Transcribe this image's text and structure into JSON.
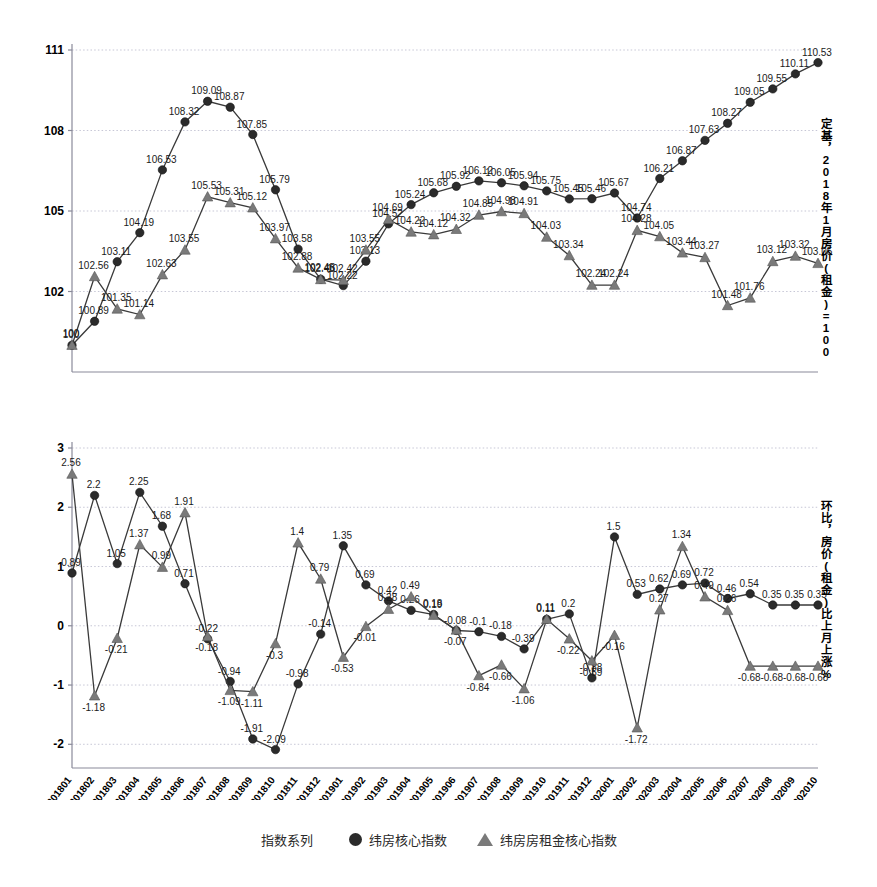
{
  "chart_data": [
    {
      "type": "line",
      "panel": "top",
      "title": "",
      "xlabel": "",
      "ylabel": "定基，2018年1月房价(租金)=100",
      "ylim": [
        99,
        111
      ],
      "yticks": [
        102,
        105,
        108,
        111
      ],
      "grid": true,
      "legend_position": "bottom",
      "categories": [
        "201801",
        "201802",
        "201803",
        "201804",
        "201805",
        "201806",
        "201807",
        "201808",
        "201809",
        "201810",
        "201811",
        "201812",
        "201901",
        "201902",
        "201903",
        "201904",
        "201905",
        "201906",
        "201907",
        "201908",
        "201909",
        "201910",
        "201911",
        "201912",
        "202001",
        "202002",
        "202003",
        "202004",
        "202005",
        "202006",
        "202007",
        "202008",
        "202009",
        "202010"
      ],
      "series": [
        {
          "name": "纬房核心指数",
          "marker": "circle",
          "values": [
            100,
            100.89,
            103.11,
            104.19,
            106.53,
            108.32,
            109.09,
            108.87,
            107.85,
            105.79,
            103.58,
            102.46,
            102.22,
            103.13,
            104.52,
            105.24,
            105.68,
            105.92,
            106.12,
            106.05,
            105.94,
            105.75,
            105.45,
            105.46,
            105.67,
            104.74,
            106.21,
            106.87,
            107.63,
            108.27,
            109.05,
            109.55,
            110.11,
            110.53
          ]
        },
        {
          "name": "纬房房租金核心指数",
          "marker": "triangle",
          "values": [
            100,
            102.56,
            101.35,
            101.14,
            102.63,
            103.55,
            105.53,
            105.31,
            105.12,
            103.97,
            102.88,
            102.45,
            102.42,
            103.55,
            104.69,
            104.22,
            104.12,
            104.32,
            104.85,
            104.98,
            104.91,
            104.03,
            103.34,
            102.24,
            102.24,
            104.28,
            104.05,
            103.44,
            103.27,
            101.48,
            101.76,
            103.12,
            103.32,
            103.05,
            102.35
          ]
        }
      ]
    },
    {
      "type": "line",
      "panel": "bottom",
      "title": "",
      "xlabel": "",
      "ylabel": "环比，房价(租金)比上月上涨%",
      "ylim": [
        -2.4,
        3
      ],
      "yticks": [
        -2,
        -1,
        0,
        1,
        2,
        3
      ],
      "grid": true,
      "legend_position": "bottom",
      "categories": [
        "201801",
        "201802",
        "201803",
        "201804",
        "201805",
        "201806",
        "201807",
        "201808",
        "201809",
        "201810",
        "201811",
        "201812",
        "201901",
        "201902",
        "201903",
        "201904",
        "201905",
        "201906",
        "201907",
        "201908",
        "201909",
        "201910",
        "201911",
        "201912",
        "202001",
        "202002",
        "202003",
        "202004",
        "202005",
        "202006",
        "202007",
        "202008",
        "202009",
        "202010"
      ],
      "series": [
        {
          "name": "纬房核心指数",
          "marker": "circle",
          "values": [
            0.89,
            2.2,
            1.05,
            2.25,
            1.68,
            0.71,
            -0.22,
            -0.94,
            -1.91,
            -2.09,
            -0.98,
            -0.14,
            1.35,
            0.69,
            0.42,
            0.26,
            0.19,
            -0.08,
            -0.1,
            -0.18,
            -0.39,
            0.11,
            0.2,
            -0.88,
            1.5,
            0.53,
            0.62,
            0.69,
            0.72,
            0.46,
            0.54,
            0.35,
            0.35,
            0.35
          ]
        },
        {
          "name": "纬房房租金核心指数",
          "marker": "triangle",
          "values": [
            2.56,
            -1.18,
            -0.21,
            1.37,
            0.99,
            1.91,
            -0.18,
            -1.09,
            -1.11,
            -0.3,
            1.4,
            0.79,
            -0.53,
            -0.01,
            0.28,
            0.49,
            0.18,
            -0.07,
            -0.84,
            -0.66,
            -1.06,
            0.11,
            -0.22,
            -0.59,
            -0.16,
            -1.72,
            0.27,
            1.34,
            0.49,
            0.26,
            -0.68,
            -0.68,
            -0.68,
            -0.68
          ]
        }
      ]
    }
  ],
  "top_chart": {
    "right_axis_label": "定基，2018年1月房价(租金)=100",
    "yticks": [
      "102",
      "105",
      "108",
      "111"
    ]
  },
  "bottom_chart": {
    "right_axis_label": "环比，房价(租金)比上月上涨%",
    "yticks": [
      "-2",
      "-1",
      "0",
      "1",
      "2",
      "3"
    ]
  },
  "legend": {
    "title": "指数系列",
    "items": [
      {
        "label": "纬房核心指数",
        "marker": "circle-marker"
      },
      {
        "label": "纬房房租金核心指数",
        "marker": "triangle-marker"
      }
    ]
  },
  "caption": {
    "text": ""
  }
}
